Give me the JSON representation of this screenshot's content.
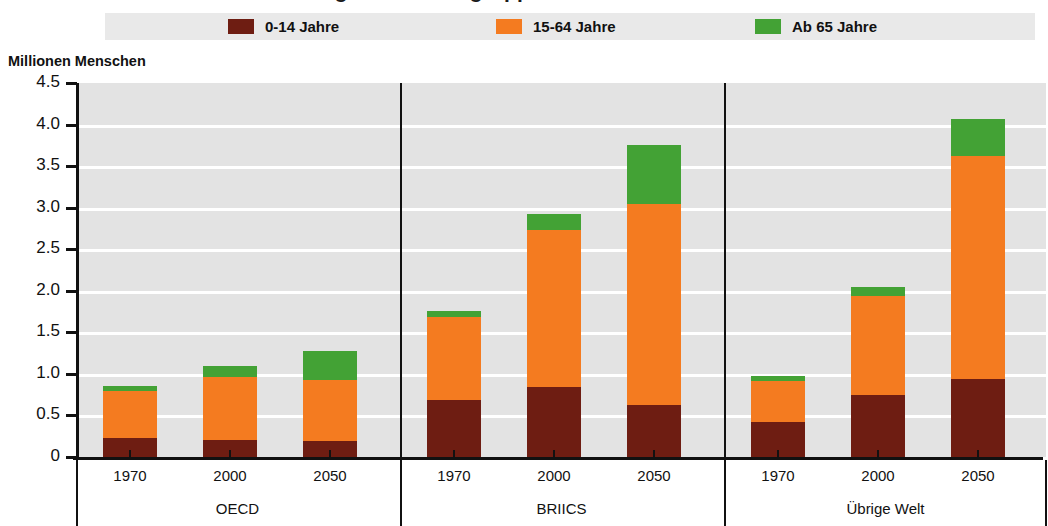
{
  "title": "Weltbevölkerung nach Altersgruppen",
  "legend": {
    "position": "top",
    "items": [
      {
        "label": "0-14 Jahre",
        "color": "#6e1d12"
      },
      {
        "label": "15-64 Jahre",
        "color": "#f47b20"
      },
      {
        "label": "Ab 65 Jahre",
        "color": "#43a235"
      }
    ]
  },
  "axis": {
    "y_title": "Millionen Menschen",
    "y_ticks": [
      "4.5",
      "4.0",
      "3.5",
      "3.0",
      "2.5",
      "2.0",
      "1.5",
      "1.0",
      "0.5",
      "0"
    ]
  },
  "groups": [
    {
      "label": "OECD",
      "years": [
        "1970",
        "2000",
        "2050"
      ]
    },
    {
      "label": "BRIICS",
      "years": [
        "1970",
        "2000",
        "2050"
      ]
    },
    {
      "label": "Übrige Welt",
      "years": [
        "1970",
        "2000",
        "2050"
      ]
    }
  ],
  "chart_data": {
    "type": "bar",
    "stacked": true,
    "title": "Weltbevölkerung nach Altersgruppen",
    "xlabel": "",
    "ylabel": "Millionen Menschen",
    "ylim": [
      0,
      4.5
    ],
    "ytick_values": [
      0,
      0.5,
      1.0,
      1.5,
      2.0,
      2.5,
      3.0,
      3.5,
      4.0,
      4.5
    ],
    "grid": true,
    "legend_position": "top",
    "groups": [
      "OECD",
      "BRIICS",
      "Übrige Welt"
    ],
    "categories": [
      "OECD 1970",
      "OECD 2000",
      "OECD 2050",
      "BRIICS 1970",
      "BRIICS 2000",
      "BRIICS 2050",
      "Übrige Welt 1970",
      "Übrige Welt 2000",
      "Übrige Welt 2050"
    ],
    "series": [
      {
        "name": "0-14 Jahre",
        "color": "#6e1d12",
        "values": [
          0.23,
          0.21,
          0.19,
          0.68,
          0.84,
          0.62,
          0.42,
          0.74,
          0.94
        ]
      },
      {
        "name": "15-64 Jahre",
        "color": "#f47b20",
        "values": [
          0.57,
          0.75,
          0.74,
          1.0,
          1.89,
          2.43,
          0.5,
          1.2,
          2.68
        ]
      },
      {
        "name": "Ab 65 Jahre",
        "color": "#43a235",
        "values": [
          0.06,
          0.14,
          0.34,
          0.08,
          0.19,
          0.7,
          0.06,
          0.1,
          0.45
        ]
      }
    ],
    "totals": [
      0.86,
      1.1,
      1.27,
      1.76,
      2.92,
      3.75,
      0.98,
      2.04,
      4.07
    ]
  }
}
